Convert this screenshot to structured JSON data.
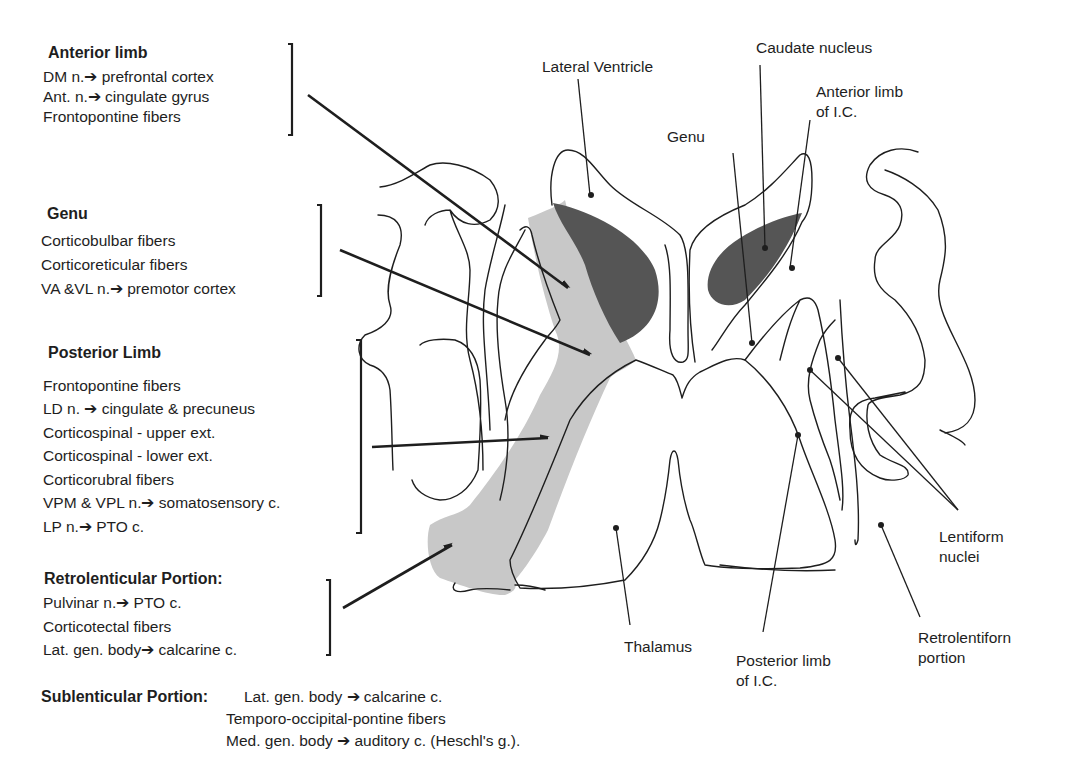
{
  "left_panel": {
    "anterior_limb": {
      "heading": "Anterior limb",
      "items": [
        "DM n.➔ prefrontal cortex",
        "Ant. n.➔ cingulate gyrus",
        "Frontopontine fibers"
      ]
    },
    "genu": {
      "heading": "Genu",
      "items": [
        "Corticobulbar fibers",
        "Corticoreticular fibers",
        "VA &VL n.➔ premotor cortex"
      ]
    },
    "posterior_limb": {
      "heading": "Posterior Limb",
      "items": [
        "Frontopontine fibers",
        "LD n. ➔ cingulate & precuneus",
        "Corticospinal - upper ext.",
        "Corticospinal - lower ext.",
        "Corticorubral fibers",
        "VPM & VPL n.➔ somatosensory c.",
        "LP n.➔ PTO c."
      ]
    },
    "retrolenticular": {
      "heading": "Retrolenticular Portion:",
      "items": [
        "Pulvinar n.➔ PTO c.",
        "Corticotectal fibers",
        "Lat. gen. body➔ calcarine c."
      ]
    },
    "sublenticular": {
      "heading": "Sublenticular Portion:",
      "items": [
        "Lat. gen. body ➔ calcarine c.",
        "Temporo-occipital-pontine fibers",
        "Med. gen. body ➔ auditory c.  (Heschl's g.)."
      ]
    }
  },
  "labels": {
    "lateral_ventricle": "Lateral Ventricle",
    "caudate_nucleus": "Caudate nucleus",
    "anterior_limb_ic": "Anterior limb\nof I.C.",
    "genu": "Genu",
    "lentiform_nuclei": "Lentiform\nnuclei",
    "thalamus": "Thalamus",
    "posterior_limb_ic": "Posterior limb\nof I.C.",
    "retrolentiform_portion": "Retrolentiforn\nportion"
  },
  "colors": {
    "internal_capsule_fill": "#c8c8c8",
    "caudate_fill": "#555555",
    "line": "#1e1e1e",
    "background": "#ffffff"
  }
}
